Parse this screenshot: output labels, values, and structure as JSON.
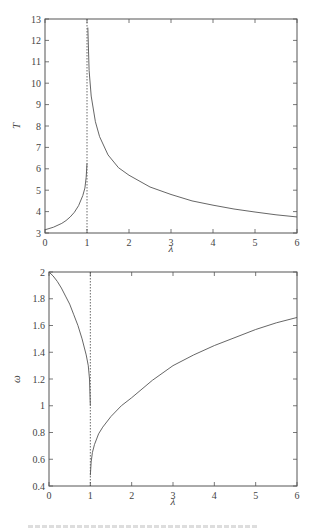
{
  "chart_data": [
    {
      "type": "line",
      "title": "",
      "xlabel": "λ",
      "ylabel": "T",
      "xlim": [
        0,
        6
      ],
      "ylim": [
        3,
        13
      ],
      "xticks": [
        0,
        1,
        2,
        3,
        4,
        5,
        6
      ],
      "yticks": [
        3,
        4,
        5,
        6,
        7,
        8,
        9,
        10,
        11,
        12,
        13
      ],
      "grid": false,
      "legend": null,
      "annotations": [
        {
          "type": "vertical-dashed-line",
          "x": 1
        }
      ],
      "series": [
        {
          "name": "T (λ < 1)",
          "x": [
            0,
            0.2,
            0.4,
            0.5,
            0.6,
            0.7,
            0.8,
            0.9,
            0.95,
            0.98,
            1.0
          ],
          "y": [
            3.15,
            3.27,
            3.45,
            3.58,
            3.75,
            3.97,
            4.28,
            4.75,
            5.1,
            5.6,
            6.25
          ]
        },
        {
          "name": "T (λ > 1)",
          "x": [
            1.02,
            1.05,
            1.1,
            1.2,
            1.3,
            1.5,
            1.75,
            2,
            2.5,
            3,
            3.5,
            4,
            4.5,
            5,
            5.5,
            6
          ],
          "y": [
            12.6,
            10.6,
            9.4,
            8.2,
            7.5,
            6.65,
            6.05,
            5.7,
            5.15,
            4.8,
            4.5,
            4.3,
            4.12,
            3.98,
            3.85,
            3.75
          ]
        }
      ]
    },
    {
      "type": "line",
      "title": "",
      "xlabel": "λ",
      "ylabel": "ω",
      "xlim": [
        0,
        6
      ],
      "ylim": [
        0.4,
        2
      ],
      "xticks": [
        0,
        1,
        2,
        3,
        4,
        5,
        6
      ],
      "yticks": [
        0.4,
        0.6,
        0.8,
        1,
        1.2,
        1.4,
        1.6,
        1.8,
        2
      ],
      "grid": false,
      "legend": null,
      "annotations": [
        {
          "type": "vertical-dashed-line",
          "x": 1
        }
      ],
      "series": [
        {
          "name": "ω (λ < 1)",
          "x": [
            0,
            0.1,
            0.2,
            0.3,
            0.4,
            0.5,
            0.6,
            0.7,
            0.8,
            0.9,
            0.95,
            0.98,
            1.0
          ],
          "y": [
            2.0,
            1.97,
            1.93,
            1.88,
            1.82,
            1.76,
            1.68,
            1.6,
            1.5,
            1.38,
            1.3,
            1.2,
            1.0
          ]
        },
        {
          "name": "ω (λ > 1)",
          "x": [
            1.0,
            1.02,
            1.05,
            1.1,
            1.2,
            1.3,
            1.5,
            1.75,
            2,
            2.5,
            3,
            3.5,
            4,
            4.5,
            5,
            5.5,
            6
          ],
          "y": [
            0.48,
            0.58,
            0.65,
            0.71,
            0.79,
            0.84,
            0.92,
            1.0,
            1.06,
            1.19,
            1.3,
            1.38,
            1.45,
            1.51,
            1.57,
            1.62,
            1.66
          ]
        }
      ]
    }
  ],
  "layout": {
    "plots": [
      {
        "left": 45,
        "top": 19,
        "right": 297,
        "bottom": 233,
        "ylabel_x": 20,
        "xlabel_y": 252
      },
      {
        "left": 49,
        "top": 272,
        "right": 297,
        "bottom": 486,
        "ylabel_x": 20,
        "xlabel_y": 505
      }
    ],
    "line_color": "#555555",
    "frame_color": "#555555",
    "dashed_color": "#444444"
  },
  "caption": {
    "visible": "truncated"
  }
}
